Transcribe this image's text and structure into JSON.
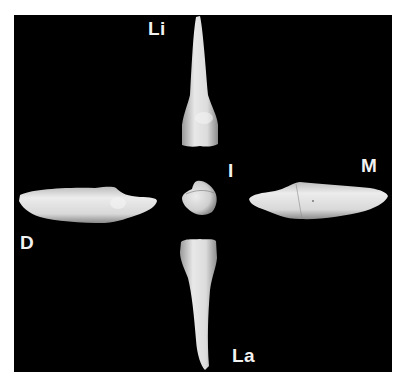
{
  "figure": {
    "background_color": "#000000",
    "tooth_color": "#e6e6e6",
    "labels": {
      "lingual": "Li",
      "incisal": "I",
      "mesial": "M",
      "distal": "D",
      "labial": "La"
    },
    "views": [
      {
        "id": "lingual",
        "label": "Li",
        "position": "top"
      },
      {
        "id": "incisal",
        "label": "I",
        "position": "center"
      },
      {
        "id": "mesial",
        "label": "M",
        "position": "right"
      },
      {
        "id": "distal",
        "label": "D",
        "position": "left"
      },
      {
        "id": "labial",
        "label": "La",
        "position": "bottom"
      }
    ]
  }
}
